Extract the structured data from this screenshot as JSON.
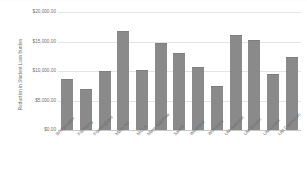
{
  "chart_data": {
    "type": "bar",
    "title": "",
    "xlabel": "",
    "ylabel": "Reduction in Student Loan burden",
    "ylim": [
      0,
      20000
    ],
    "grid": true,
    "legend": "none",
    "y_ticks": [
      {
        "value": 20000,
        "label": "$20,000.00"
      },
      {
        "value": 15000,
        "label": "$15,000.00"
      },
      {
        "value": 10000,
        "label": "$10,000.00"
      },
      {
        "value": 5000,
        "label": "$5,000.00"
      },
      {
        "value": 0,
        "label": "$0.00"
      }
    ],
    "categories": [
      "Bridgewater",
      "Fitchburg",
      "Framingham",
      "Mass Art",
      "MCLA",
      "Mass Maritime",
      "Salem",
      "Westfield",
      "Worcester",
      "UM Amherst",
      "UM Boston",
      "UM Lowell",
      "UM Dartmouth"
    ],
    "values": [
      8600,
      6900,
      10000,
      16800,
      10200,
      14700,
      13100,
      10600,
      7400,
      16100,
      15200,
      9500,
      12400
    ],
    "bar_color": "#8a8a8a",
    "gridline_color": "#e4e4e4",
    "axis_color": "#c9c9c9",
    "text_color": "#6f6f6f",
    "background_color": "#ffffff"
  }
}
